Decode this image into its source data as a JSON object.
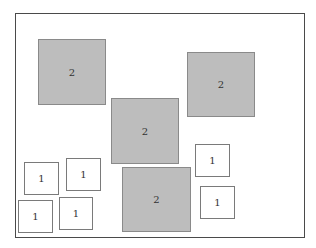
{
  "frame": {
    "x": 15,
    "y": 13,
    "w": 290,
    "h": 225,
    "border_color": "#4a4a4a"
  },
  "colors": {
    "big_fill": "#bdbdbd",
    "big_border": "#8a8a8a",
    "small_fill": "#ffffff",
    "small_border": "#7a7a7a"
  },
  "boxes": [
    {
      "label": "2",
      "size": "big",
      "x": 38,
      "y": 39,
      "w": 68,
      "h": 66
    },
    {
      "label": "2",
      "size": "big",
      "x": 111,
      "y": 98,
      "w": 68,
      "h": 66
    },
    {
      "label": "2",
      "size": "big",
      "x": 187,
      "y": 52,
      "w": 68,
      "h": 65
    },
    {
      "label": "2",
      "size": "big",
      "x": 122,
      "y": 167,
      "w": 69,
      "h": 65
    },
    {
      "label": "1",
      "size": "small",
      "x": 24,
      "y": 162,
      "w": 35,
      "h": 33
    },
    {
      "label": "1",
      "size": "small",
      "x": 66,
      "y": 158,
      "w": 35,
      "h": 33
    },
    {
      "label": "1",
      "size": "small",
      "x": 18,
      "y": 200,
      "w": 35,
      "h": 33
    },
    {
      "label": "1",
      "size": "small",
      "x": 59,
      "y": 197,
      "w": 34,
      "h": 33
    },
    {
      "label": "1",
      "size": "small",
      "x": 195,
      "y": 144,
      "w": 35,
      "h": 33
    },
    {
      "label": "1",
      "size": "small",
      "x": 200,
      "y": 186,
      "w": 35,
      "h": 33
    }
  ]
}
